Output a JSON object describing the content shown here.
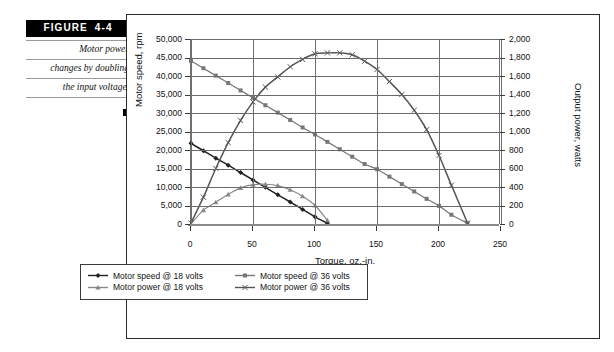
{
  "figure": {
    "tag_word": "FIGURE",
    "tag_number": "4-4",
    "caption_lines": [
      "Motor power",
      "changes by doubling",
      "the input voltage."
    ],
    "end_marker": "square-bullet"
  },
  "chart_data": {
    "type": "line",
    "title": "",
    "xlabel": "Torque, oz.-in.",
    "ylabel": "Motor speed, rpm",
    "y2label": "Output power, watts",
    "xlim": [
      0,
      250
    ],
    "ylim": [
      0,
      50000
    ],
    "y2lim": [
      0,
      2000
    ],
    "xticks": [
      0,
      50,
      100,
      150,
      200,
      250
    ],
    "xticklabels": [
      "0",
      "50",
      "100",
      "150",
      "200",
      "250"
    ],
    "yticks": [
      0,
      5000,
      10000,
      15000,
      20000,
      25000,
      30000,
      35000,
      40000,
      45000,
      50000
    ],
    "yticklabels": [
      "0",
      "5,000",
      "10,000",
      "15,000",
      "20,000",
      "25,000",
      "30,000",
      "35,000",
      "40,000",
      "45,000",
      "50,000"
    ],
    "y2ticks": [
      0,
      200,
      400,
      600,
      800,
      1000,
      1200,
      1400,
      1600,
      1800,
      2000
    ],
    "y2ticklabels": [
      "0",
      "200",
      "400",
      "600",
      "800",
      "1,000",
      "1,200",
      "1,400",
      "1,600",
      "1,800",
      "2,000"
    ],
    "grid": true,
    "legend_position": "below-axes",
    "series": [
      {
        "name": "Motor speed @ 18 volts",
        "axis": "left",
        "color": "#222222",
        "marker": "diamond",
        "x": [
          0,
          10,
          20,
          30,
          40,
          50,
          60,
          70,
          80,
          90,
          100,
          110
        ],
        "values": [
          21800,
          19800,
          17800,
          15900,
          13900,
          11900,
          9900,
          7900,
          5950,
          3950,
          1950,
          200
        ]
      },
      {
        "name": "Motor speed @ 36 volts",
        "axis": "left",
        "color": "#777777",
        "marker": "square",
        "x": [
          0,
          10,
          20,
          30,
          40,
          50,
          60,
          70,
          80,
          90,
          100,
          110,
          120,
          130,
          140,
          150,
          160,
          170,
          180,
          190,
          200,
          210,
          223
        ],
        "values": [
          44100,
          42100,
          40100,
          38100,
          36100,
          34100,
          32100,
          30100,
          28100,
          26100,
          24200,
          22200,
          20200,
          18200,
          16200,
          14800,
          12800,
          10800,
          8800,
          6800,
          4900,
          2500,
          200
        ]
      },
      {
        "name": "Motor power @ 18 volts",
        "axis": "right",
        "color": "#888888",
        "marker": "triangle",
        "x": [
          0,
          10,
          20,
          30,
          40,
          50,
          60,
          70,
          80,
          90,
          100,
          110
        ],
        "values": [
          0,
          150,
          235,
          320,
          390,
          425,
          430,
          415,
          370,
          300,
          200,
          40
        ]
      },
      {
        "name": "Motor power @ 36 volts",
        "axis": "right",
        "color": "#555555",
        "marker": "cross",
        "x": [
          0,
          10,
          20,
          30,
          40,
          50,
          60,
          70,
          80,
          90,
          100,
          110,
          120,
          130,
          140,
          150,
          160,
          170,
          180,
          190,
          200,
          210,
          223
        ],
        "values": [
          10,
          290,
          600,
          880,
          1120,
          1320,
          1480,
          1590,
          1700,
          1780,
          1840,
          1850,
          1850,
          1830,
          1760,
          1670,
          1540,
          1400,
          1230,
          1020,
          740,
          420,
          10
        ]
      }
    ]
  },
  "legend": {
    "entries": [
      "Motor speed @ 18 volts",
      "Motor speed @ 36 volts",
      "Motor power @ 18 volts",
      "Motor power @ 36 volts"
    ]
  }
}
